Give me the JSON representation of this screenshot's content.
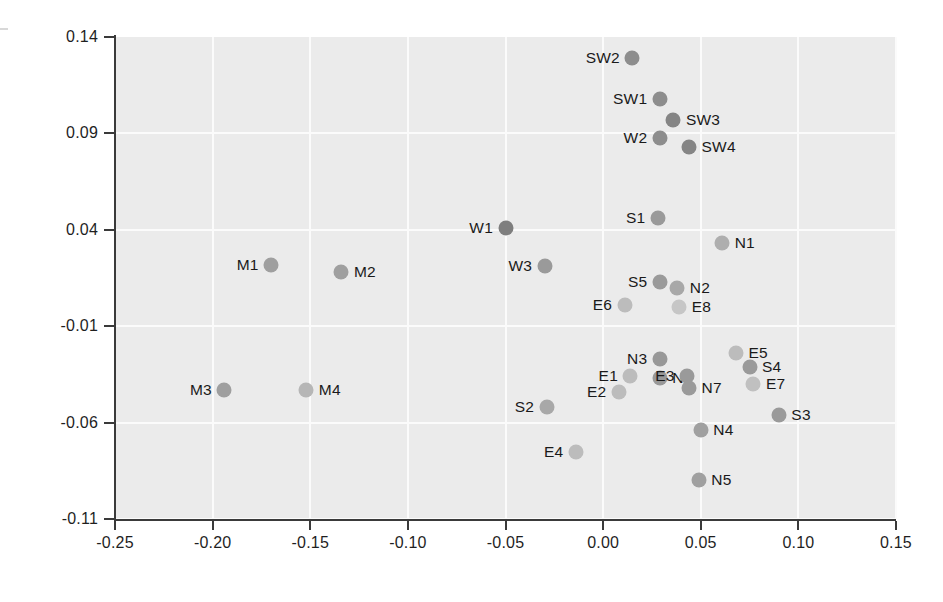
{
  "chart_data": {
    "type": "scatter",
    "title": "",
    "xlabel": "",
    "ylabel": "",
    "xlim": [
      -0.25,
      0.15
    ],
    "ylim": [
      -0.11,
      0.14
    ],
    "xticks": [
      "-0.25",
      "-0.20",
      "-0.15",
      "-0.10",
      "-0.05",
      "0.00",
      "0.05",
      "0.10",
      "0.15"
    ],
    "xtick_values": [
      -0.25,
      -0.2,
      -0.15,
      -0.1,
      -0.05,
      0.0,
      0.05,
      0.1,
      0.15
    ],
    "yticks": [
      "0.14",
      "0.09",
      "0.04",
      "-0.01",
      "-0.06",
      "-0.11"
    ],
    "ytick_values": [
      0.14,
      0.09,
      0.04,
      -0.01,
      -0.06,
      -0.11
    ],
    "grid": true,
    "legend": "none",
    "plot_background": "#ebebeb",
    "grid_color": "#fbfbfb",
    "axis_color": "#3a3a3a",
    "marker_size_px": 15,
    "points": [
      {
        "label": "SW2",
        "x": 0.015,
        "y": 0.129,
        "color": "#8d8d8d",
        "label_side": "left"
      },
      {
        "label": "SW1",
        "x": 0.029,
        "y": 0.108,
        "color": "#8d8d8d",
        "label_side": "left"
      },
      {
        "label": "SW3",
        "x": 0.036,
        "y": 0.097,
        "color": "#858585",
        "label_side": "right"
      },
      {
        "label": "W2",
        "x": 0.029,
        "y": 0.0875,
        "color": "#8d8d8d",
        "label_side": "left"
      },
      {
        "label": "SW4",
        "x": 0.044,
        "y": 0.083,
        "color": "#858585",
        "label_side": "right"
      },
      {
        "label": "S1",
        "x": 0.028,
        "y": 0.046,
        "color": "#9a9a9a",
        "label_side": "left"
      },
      {
        "label": "W1",
        "x": -0.05,
        "y": 0.041,
        "color": "#7e7e7e",
        "label_side": "left"
      },
      {
        "label": "N1",
        "x": 0.061,
        "y": 0.033,
        "color": "#aeaeae",
        "label_side": "right"
      },
      {
        "label": "M1",
        "x": -0.17,
        "y": 0.022,
        "color": "#9f9f9f",
        "label_side": "left"
      },
      {
        "label": "W3",
        "x": -0.03,
        "y": 0.021,
        "color": "#9a9a9a",
        "label_side": "left"
      },
      {
        "label": "M2",
        "x": -0.134,
        "y": 0.018,
        "color": "#9f9f9f",
        "label_side": "right"
      },
      {
        "label": "S5",
        "x": 0.029,
        "y": 0.013,
        "color": "#9a9a9a",
        "label_side": "left"
      },
      {
        "label": "N2",
        "x": 0.038,
        "y": 0.01,
        "color": "#a8a8a8",
        "label_side": "right"
      },
      {
        "label": "E6",
        "x": 0.011,
        "y": 0.001,
        "color": "#bcbcbc",
        "label_side": "left"
      },
      {
        "label": "E8",
        "x": 0.039,
        "y": 0.0,
        "color": "#c6c6c6",
        "label_side": "right"
      },
      {
        "label": "E5",
        "x": 0.068,
        "y": -0.024,
        "color": "#bcbcbc",
        "label_side": "right"
      },
      {
        "label": "N3",
        "x": 0.029,
        "y": -0.027,
        "color": "#989898",
        "label_side": "left"
      },
      {
        "label": "M3",
        "x": -0.194,
        "y": -0.043,
        "color": "#9f9f9f",
        "label_side": "left"
      },
      {
        "label": "M4",
        "x": -0.152,
        "y": -0.043,
        "color": "#b6b6b6",
        "label_side": "right"
      },
      {
        "label": "E1",
        "x": 0.014,
        "y": -0.036,
        "color": "#bcbcbc",
        "label_side": "left"
      },
      {
        "label": "S4",
        "x": 0.075,
        "y": -0.031,
        "color": "#9a9a9a",
        "label_side": "right"
      },
      {
        "label": "N6",
        "x": 0.029,
        "y": -0.037,
        "color": "#989898",
        "label_side": "right"
      },
      {
        "label": "E3",
        "x": 0.043,
        "y": -0.036,
        "color": "#9a9a9a",
        "label_side": "left"
      },
      {
        "label": "E7",
        "x": 0.077,
        "y": -0.04,
        "color": "#c0c0c0",
        "label_side": "right"
      },
      {
        "label": "E2",
        "x": 0.008,
        "y": -0.044,
        "color": "#bcbcbc",
        "label_side": "left"
      },
      {
        "label": "N7",
        "x": 0.044,
        "y": -0.042,
        "color": "#9a9a9a",
        "label_side": "right"
      },
      {
        "label": "S2",
        "x": -0.029,
        "y": -0.052,
        "color": "#a8a8a8",
        "label_side": "left"
      },
      {
        "label": "S3",
        "x": 0.09,
        "y": -0.056,
        "color": "#9a9a9a",
        "label_side": "right"
      },
      {
        "label": "N4",
        "x": 0.05,
        "y": -0.064,
        "color": "#a0a0a0",
        "label_side": "right"
      },
      {
        "label": "E4",
        "x": -0.014,
        "y": -0.075,
        "color": "#bcbcbc",
        "label_side": "left"
      },
      {
        "label": "N5",
        "x": 0.049,
        "y": -0.09,
        "color": "#a0a0a0",
        "label_side": "right"
      }
    ]
  }
}
